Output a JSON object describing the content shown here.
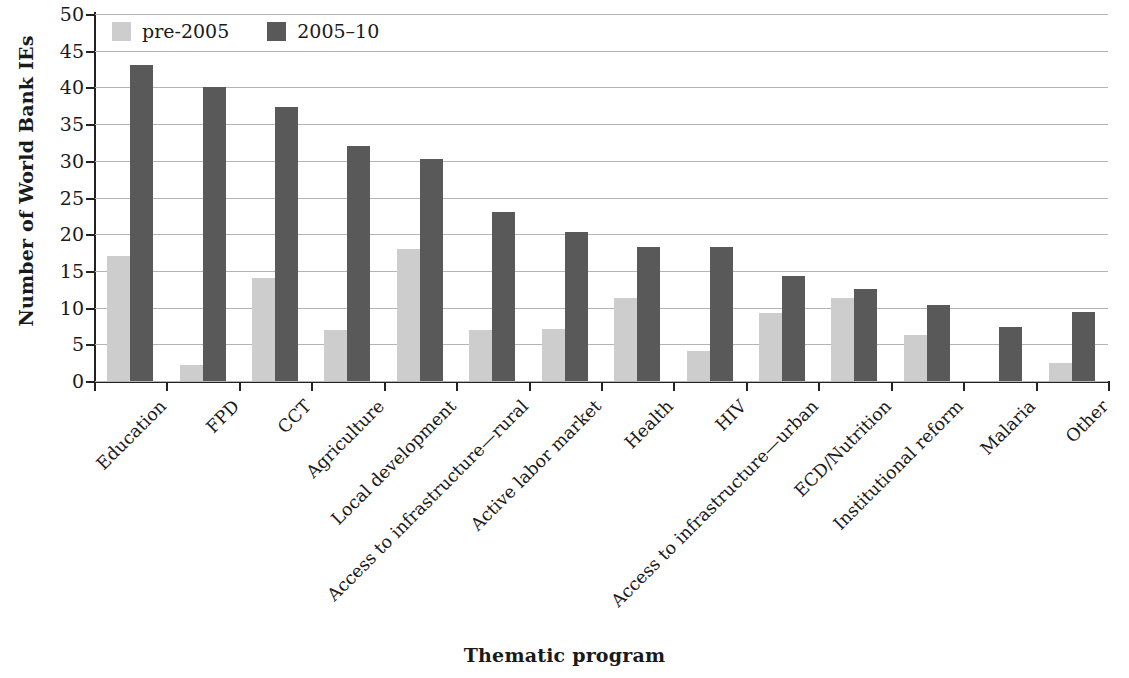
{
  "chart_data": {
    "type": "bar",
    "title": "",
    "xlabel": "Thematic program",
    "ylabel": "Number of World Bank IEs",
    "ylim": [
      0,
      50
    ],
    "ytick_step": 5,
    "yticks": [
      50,
      45,
      40,
      35,
      30,
      25,
      20,
      15,
      10,
      5,
      0
    ],
    "grid": true,
    "legend_position": "top-left",
    "categories": [
      "Education",
      "FPD",
      "CCT",
      "Agriculture",
      "Local development",
      "Access to infrastructure—rural",
      "Active labor market",
      "Health",
      "HIV",
      "Access to infrastructure—urban",
      "ECD/Nutrition",
      "Institutional reform",
      "Malaria",
      "Other"
    ],
    "series": [
      {
        "name": "pre-2005",
        "color": "#cdcdcd",
        "values": [
          17,
          2.2,
          14,
          7,
          18,
          7,
          7.1,
          11.3,
          4.1,
          9.2,
          11.3,
          6.3,
          0,
          2.5
        ]
      },
      {
        "name": "2005–10",
        "color": "#595959",
        "values": [
          43,
          40,
          37.3,
          32,
          30.3,
          23,
          20.3,
          18.3,
          18.3,
          14.3,
          12.5,
          10.4,
          7.3,
          9.4
        ]
      }
    ]
  },
  "legend": {
    "entries": [
      {
        "label": "pre-2005",
        "swatch": "light-gray-swatch"
      },
      {
        "label": "2005–10",
        "swatch": "dark-gray-swatch"
      }
    ]
  },
  "axes": {
    "y_title": "Number of World Bank IEs",
    "x_title": "Thematic program"
  },
  "colors": {
    "pre_2005": "#cdcdcd",
    "period_2005_10": "#595959",
    "gridline": "#b4b4b4",
    "axis": "#222222",
    "text": "#1a1a1a",
    "background": "#ffffff"
  }
}
